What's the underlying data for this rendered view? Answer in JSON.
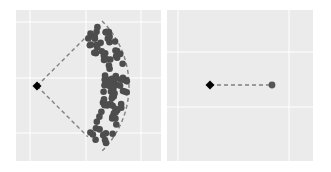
{
  "chart_data": [
    {
      "type": "scatter",
      "title": "",
      "xlabel": "",
      "ylabel": "",
      "grid": true,
      "background": "#ebebeb",
      "gridline_color": "#ffffff",
      "description": "Single diamond origin point with dashed lines to the endpoints of an arc-shaped cloud of dark gray points; dashed arc bounds the cloud",
      "origin": {
        "x": 0,
        "y": 0,
        "marker": "diamond",
        "color": "#000000"
      },
      "points_color": "#4d4d4d",
      "arc": {
        "radius": 1.0,
        "angle_start_deg": -45,
        "angle_end_deg": 45,
        "style": "dashed",
        "color": "#808080"
      },
      "n_points": 100,
      "point_spread": "radial distance roughly 0.75–1.0 of arc radius, angle spanning -45° to 45°"
    },
    {
      "type": "scatter",
      "title": "",
      "xlabel": "",
      "ylabel": "",
      "grid": true,
      "background": "#ebebeb",
      "gridline_color": "#ffffff",
      "description": "Diamond origin connected by a horizontal dashed line to a single gray point",
      "origin": {
        "x": 0,
        "y": 0,
        "marker": "diamond",
        "color": "#000000"
      },
      "points": [
        {
          "x": 1.0,
          "y": 0,
          "marker": "circle",
          "color": "#555555"
        }
      ],
      "segment": {
        "style": "dashed",
        "color": "#808080"
      }
    }
  ]
}
